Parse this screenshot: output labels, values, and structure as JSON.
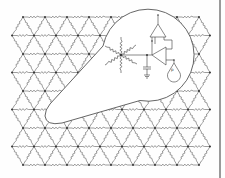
{
  "figure": {
    "colors": {
      "line": "#4a4a4a",
      "resistor": "#5a5a5a",
      "node": "#2a2a2a",
      "background": "#ffffff",
      "page_border": "#9a9a9a"
    },
    "lattice": {
      "type": "triangular",
      "rows": 9,
      "row_spacing_px": 18.5,
      "col_spacing_px": 22,
      "top_y": 17,
      "odd_row_start_x": 23,
      "even_row_start_x": 12,
      "nodes_per_row": 9
    },
    "magnifier": {
      "shape": "circle-with-tail",
      "center": [
        145,
        55
      ],
      "radius": 46,
      "tail_tip": [
        45,
        118
      ]
    },
    "inset_circuit": {
      "central_node": [
        121,
        55
      ],
      "resistor_count": 6,
      "components": [
        "resistor",
        "resistor",
        "resistor",
        "resistor",
        "resistor",
        "resistor",
        "op-amp (upper)",
        "op-amp (lower)",
        "capacitor",
        "ground",
        "electrode-probe"
      ],
      "probe_label": "p"
    }
  }
}
